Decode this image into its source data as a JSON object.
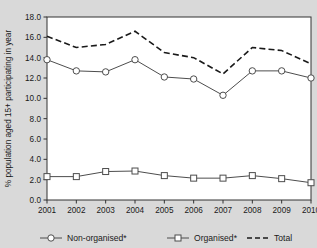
{
  "chart_data": {
    "type": "line",
    "title": "",
    "subtitle": "",
    "xlabel": "",
    "ylabel": "% population aged 15+ participating in year",
    "categories": [
      "2001",
      "2002",
      "2003",
      "2004",
      "2005",
      "2006",
      "2007",
      "2008",
      "2009",
      "2010"
    ],
    "x": [
      2001,
      2002,
      2003,
      2004,
      2005,
      2006,
      2007,
      2008,
      2009,
      2010
    ],
    "xlim": [
      2001,
      2010
    ],
    "ylim": [
      0.0,
      18.0
    ],
    "ytick_step": 2.0,
    "yticks": [
      "0.0",
      "2.0",
      "4.0",
      "6.0",
      "8.0",
      "10.0",
      "12.0",
      "14.0",
      "16.0",
      "18.0"
    ],
    "ytick_values": [
      0.0,
      2.0,
      4.0,
      6.0,
      8.0,
      10.0,
      12.0,
      14.0,
      16.0,
      18.0
    ],
    "grid": false,
    "legend_position": "bottom",
    "series": [
      {
        "name": "Non-organised*",
        "marker": "open-circle",
        "linestyle": "solid",
        "color": "#4d4d4d",
        "values": [
          13.8,
          12.7,
          12.6,
          13.8,
          12.1,
          11.9,
          10.3,
          12.7,
          12.7,
          12.0
        ]
      },
      {
        "name": "Organised*",
        "marker": "open-square",
        "linestyle": "solid",
        "color": "#4d4d4d",
        "values": [
          2.3,
          2.3,
          2.8,
          2.85,
          2.4,
          2.15,
          2.15,
          2.4,
          2.1,
          1.7
        ]
      },
      {
        "name": "Total",
        "marker": "none",
        "linestyle": "dashed",
        "color": "#1a1a1a",
        "values": [
          16.1,
          15.0,
          15.3,
          16.6,
          14.5,
          14.0,
          12.4,
          15.0,
          14.7,
          13.4
        ]
      }
    ]
  },
  "colors": {
    "page_background": "#d9d9d9",
    "plot_background": "#ffffff",
    "axis": "#333333",
    "text": "#1a1a1a",
    "series_line": "#4d4d4d",
    "total_line": "#1a1a1a",
    "marker_fill": "#ffffff"
  },
  "legend": {
    "items": [
      {
        "label": "Non-organised*",
        "marker": "open-circle",
        "style": "solid"
      },
      {
        "label": "Organised*",
        "marker": "open-square",
        "style": "solid"
      },
      {
        "label": "Total",
        "marker": "none",
        "style": "dashed"
      }
    ]
  }
}
